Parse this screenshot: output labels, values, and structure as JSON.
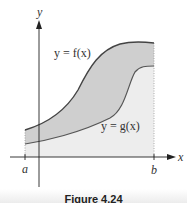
{
  "figure": {
    "caption": "Figure 4.24",
    "axes": {
      "x_label": "x",
      "y_label": "y",
      "a_label": "a",
      "b_label": "b"
    },
    "curves": {
      "upper": {
        "label": "y = f(x)",
        "name": "f(x)"
      },
      "lower": {
        "label": "y = g(x)",
        "name": "g(x)"
      }
    },
    "colors": {
      "between_fill": "#cfcfcf",
      "below_fill": "#ededed",
      "curve_upper": "#444444",
      "curve_lower": "#555555",
      "axis": "#222222"
    }
  }
}
